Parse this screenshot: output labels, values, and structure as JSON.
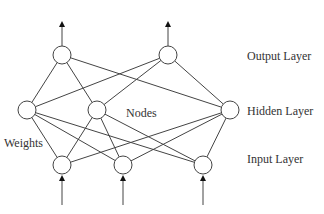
{
  "diagram": {
    "labels": {
      "output_layer": "Output Layer",
      "hidden_layer": "Hidden Layer",
      "input_layer": "Input Layer",
      "nodes": "Nodes",
      "weights": "Weights"
    },
    "layers": {
      "output": [
        {
          "x": 62,
          "y": 55
        },
        {
          "x": 168,
          "y": 55
        }
      ],
      "hidden": [
        {
          "x": 27,
          "y": 110
        },
        {
          "x": 97,
          "y": 110
        },
        {
          "x": 230,
          "y": 110
        }
      ],
      "input": [
        {
          "x": 62,
          "y": 165
        },
        {
          "x": 123,
          "y": 165
        },
        {
          "x": 203,
          "y": 165
        }
      ]
    },
    "node_radius": 9,
    "colors": {
      "stroke": "#444444",
      "text": "#333333"
    }
  }
}
